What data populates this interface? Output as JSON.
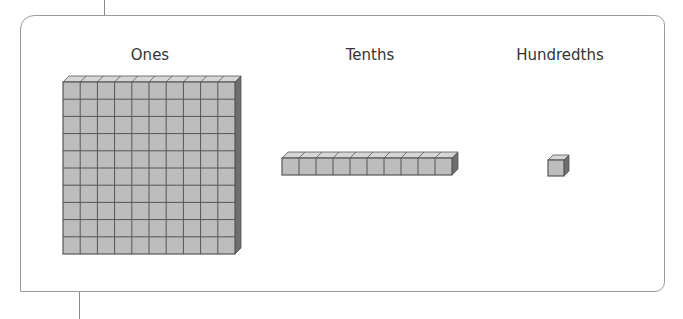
{
  "diagram": {
    "labels": {
      "ones": "Ones",
      "tenths": "Tenths",
      "hundredths": "Hundredths"
    },
    "blocks": {
      "ones": {
        "rows": 10,
        "cols": 10
      },
      "tenths": {
        "rows": 1,
        "cols": 10
      },
      "hundredths": {
        "rows": 1,
        "cols": 1
      }
    },
    "colors": {
      "face": "#bdbdbd",
      "top": "#d6d6d6",
      "side": "#6e6e6e",
      "grid": "#555555",
      "frame": "#9a9a9a"
    }
  }
}
